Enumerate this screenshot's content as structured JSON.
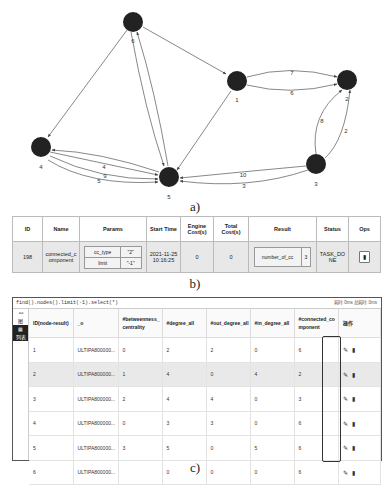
{
  "graph": {
    "caption": "a)",
    "nodes": [
      {
        "id": "6",
        "label": "6",
        "x": 133,
        "y": 22
      },
      {
        "id": "1",
        "label": "1",
        "x": 237,
        "y": 81
      },
      {
        "id": "2",
        "label": "2",
        "x": 347,
        "y": 80
      },
      {
        "id": "4",
        "label": "4",
        "x": 41,
        "y": 147
      },
      {
        "id": "5",
        "label": "5",
        "x": 169,
        "y": 177
      },
      {
        "id": "3",
        "label": "3",
        "x": 316,
        "y": 164
      }
    ],
    "edges": [
      {
        "from": "6",
        "to": "1",
        "label": ""
      },
      {
        "from": "6",
        "to": "4",
        "label": ""
      },
      {
        "from": "6",
        "to": "5",
        "label": ""
      },
      {
        "from": "5",
        "to": "6",
        "label": ""
      },
      {
        "from": "1",
        "to": "2",
        "label": "7"
      },
      {
        "from": "1",
        "to": "2",
        "label": "6"
      },
      {
        "from": "1",
        "to": "5",
        "label": ""
      },
      {
        "from": "3",
        "to": "2",
        "label": "8"
      },
      {
        "from": "3",
        "to": "2",
        "label": "2"
      },
      {
        "from": "3",
        "to": "5",
        "label": "10"
      },
      {
        "from": "3",
        "to": "5",
        "label": "3"
      },
      {
        "from": "4",
        "to": "5",
        "label": "4"
      },
      {
        "from": "4",
        "to": "5",
        "label": "9"
      },
      {
        "from": "4",
        "to": "5",
        "label": "5"
      },
      {
        "from": "5",
        "to": "4",
        "label": ""
      }
    ],
    "edge_labels": {
      "e12a": "7",
      "e12b": "6",
      "e32a": "8",
      "e32b": "2",
      "e35a": "10",
      "e35b": "3",
      "e45a": "4",
      "e45b": "9",
      "e45c": "5"
    }
  },
  "task_table": {
    "caption": "b)",
    "headers": [
      "ID",
      "Name",
      "Params",
      "Start Time",
      "Engine Cost(s)",
      "Total Cost(s)",
      "Result",
      "Status",
      "Ops"
    ],
    "row": {
      "id": "198",
      "name": "connected_component",
      "params": [
        {
          "key": "cc_type",
          "value": "\"2\""
        },
        {
          "key": "limit",
          "value": "\"-1\""
        }
      ],
      "start_time": "2021-11-25 10:16:25",
      "engine_cost": "0",
      "total_cost": "0",
      "result": {
        "key": "number_of_cc",
        "value": "3"
      },
      "status": "TASK_DONE",
      "ops_icon": "delete-icon"
    }
  },
  "query_panel": {
    "caption": "c)",
    "query": "find().nodes().limit(-1).select(*)",
    "stats": "耗时: 0ms  总耗时: 0ms",
    "side_buttons": [
      {
        "label": "图",
        "icon": "graph-icon",
        "active": false
      },
      {
        "label": "列表",
        "icon": "table-icon",
        "active": true
      }
    ],
    "headers": [
      "ID(node-result)",
      "_o",
      "#betweenness_centrality",
      "#degree_all",
      "#out_degree_all",
      "#in_degree_all",
      "#connected_component",
      "操作"
    ],
    "rows": [
      [
        "1",
        "ULTIPA800000...",
        "0",
        "2",
        "2",
        "0",
        "6"
      ],
      [
        "2",
        "ULTIPA800000...",
        "1",
        "4",
        "0",
        "4",
        "2"
      ],
      [
        "3",
        "ULTIPA800000...",
        "2",
        "4",
        "4",
        "0",
        "3"
      ],
      [
        "4",
        "ULTIPA800000...",
        "0",
        "3",
        "3",
        "0",
        "6"
      ],
      [
        "5",
        "ULTIPA800000...",
        "3",
        "5",
        "0",
        "5",
        "6"
      ],
      [
        "6",
        "ULTIPA800000...",
        "",
        "0",
        "0",
        "0",
        "6"
      ]
    ],
    "row_actions": {
      "edit": "✎",
      "delete": "🗑"
    }
  }
}
